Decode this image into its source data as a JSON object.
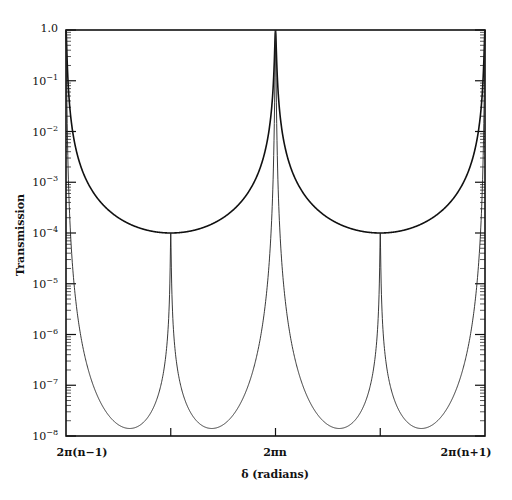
{
  "chart_data": {
    "type": "line",
    "title": "",
    "xlabel": "δ (radians)",
    "ylabel": "Transmission",
    "yscale": "log",
    "ylim": [
      1e-08,
      1.0
    ],
    "xlim": [
      "2π(n−1)",
      "2π(n+1)"
    ],
    "x_tick_labels": [
      "2π(n−1)",
      "2πn",
      "2π(n+1)"
    ],
    "y_tick_labels": [
      "1.0",
      "10^-1",
      "10^-2",
      "10^-3",
      "10^-4",
      "10^-5",
      "10^-6",
      "10^-7",
      "10^-8"
    ],
    "grid": false,
    "legend": null,
    "series": [
      {
        "name": "single cavity (upper, thick)",
        "description": "Airy transmission peaks of 1.0 at 2π(n−1) and 2π(n+1); minimum ≈1e-4 at 2πn",
        "points": [
          {
            "x": "2π(n−1)",
            "y": 1.0
          },
          {
            "x": "2π(n−1)+0.25π",
            "y": 0.0068
          },
          {
            "x": "2π(n−1)+0.5π",
            "y": 0.0007
          },
          {
            "x": "2πn",
            "y": 0.0001
          },
          {
            "x": "2π(n+1)−0.5π",
            "y": 0.0007
          },
          {
            "x": "2π(n+1)",
            "y": 1.0
          }
        ]
      },
      {
        "name": "coupled cavity (lower, thin)",
        "description": "Peaks of 1.0 at 2π(n−1) and 2π(n+1), cusp of ≈1e-4 at 2πn, minima ≈1.7e-8 near 2π(n−1)+0.58π and 2π(n+1)−0.58π",
        "points": [
          {
            "x": "2π(n−1)",
            "y": 1.0
          },
          {
            "x": "2π(n−1)+0.58π",
            "y": 1.7e-08
          },
          {
            "x": "2πn",
            "y": 0.0001
          },
          {
            "x": "2π(n+1)−0.58π",
            "y": 1.7e-08
          },
          {
            "x": "2π(n+1)",
            "y": 1.0
          }
        ]
      }
    ],
    "model": {
      "F": 9999,
      "G": 12000
    }
  },
  "axes": {
    "y_ticks": [
      {
        "base": "1.0",
        "exp": ""
      },
      {
        "base": "10",
        "exp": "−1"
      },
      {
        "base": "10",
        "exp": "−2"
      },
      {
        "base": "10",
        "exp": "−3"
      },
      {
        "base": "10",
        "exp": "−4"
      },
      {
        "base": "10",
        "exp": "−5"
      },
      {
        "base": "10",
        "exp": "−6"
      },
      {
        "base": "10",
        "exp": "−7"
      },
      {
        "base": "10",
        "exp": "−8"
      }
    ],
    "x_ticks": [
      "2π(n−1)",
      "2πn",
      "2π(n+1)"
    ],
    "xlabel": "δ (radians)",
    "ylabel": "Transmission"
  }
}
